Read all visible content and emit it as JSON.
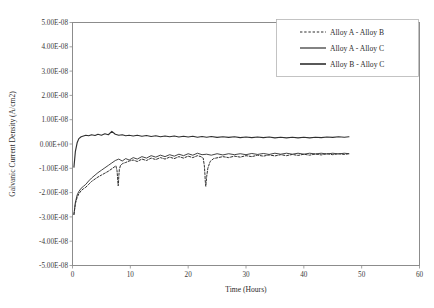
{
  "chart_data": {
    "type": "line",
    "title": "",
    "xlabel": "Time (Hours)",
    "ylabel": "Galvanic Current Density (A/cm2)",
    "xlim": [
      0,
      60
    ],
    "ylim": [
      -5e-08,
      5e-08
    ],
    "xticks": [
      0,
      10,
      20,
      30,
      40,
      50,
      60
    ],
    "xtick_labels": [
      "0",
      "10",
      "20",
      "30",
      "40",
      "50",
      "60"
    ],
    "yticks": [
      5e-08,
      4e-08,
      3e-08,
      2e-08,
      1e-08,
      0,
      -1e-08,
      -2e-08,
      -3e-08,
      -4e-08,
      -5e-08
    ],
    "ytick_labels": [
      "5.00E-08",
      "4.00E-08",
      "3.00E-08",
      "2.00E-08",
      "1.00E-08",
      "0.00E+00",
      "-1.00E-08",
      "-2.00E-08",
      "-3.00E-08",
      "-4.00E-08",
      "-5.00E-08"
    ],
    "grid": false,
    "legend_position": "top-right",
    "legend": [
      "Alloy A - Alloy B",
      "Alloy A - Alloy C",
      "Alloy B - Alloy C"
    ],
    "series": [
      {
        "name": "Alloy A - Alloy B",
        "style": "dashed",
        "color": "#2f2f2f",
        "x": [
          0.25,
          0.5,
          0.8,
          1.1,
          1.5,
          1.9,
          2.3,
          2.8,
          3.3,
          3.9,
          4.4,
          5.0,
          5.6,
          6.2,
          6.8,
          7.2,
          7.5,
          7.7,
          7.8,
          7.85,
          7.9,
          7.95,
          8.0,
          8.1,
          8.3,
          8.7,
          9.2,
          9.8,
          10.5,
          11.2,
          12.0,
          12.8,
          13.6,
          14.4,
          15.2,
          16.0,
          16.8,
          17.6,
          18.4,
          19.2,
          20.0,
          20.8,
          21.6,
          22.2,
          22.6,
          22.8,
          22.9,
          22.95,
          23.0,
          23.05,
          23.1,
          23.2,
          23.4,
          23.8,
          24.4,
          25.2,
          26.0,
          27.0,
          28.0,
          29.0,
          30.0,
          31.0,
          32.0,
          33.0,
          34.0,
          35.0,
          36.0,
          37.0,
          38.0,
          39.0,
          40.0,
          41.0,
          42.0,
          43.0,
          44.0,
          45.0,
          46.0,
          47.0,
          47.8
        ],
        "y": [
          -2.9e-08,
          -2.45e-08,
          -2.2e-08,
          -2.05e-08,
          -1.92e-08,
          -1.84e-08,
          -1.78e-08,
          -1.66e-08,
          -1.54e-08,
          -1.44e-08,
          -1.36e-08,
          -1.28e-08,
          -1.2e-08,
          -1.12e-08,
          -1.02e-08,
          -9.5e-09,
          -9e-09,
          -1.1e-08,
          -1.4e-08,
          -1.6e-08,
          -1.72e-08,
          -1.6e-08,
          -1.35e-08,
          -1.05e-08,
          -8.8e-09,
          -8e-09,
          -7.6e-09,
          -7e-09,
          -6.6e-09,
          -7.2e-09,
          -6.2e-09,
          -6.8e-09,
          -5.8e-09,
          -6.4e-09,
          -5.6e-09,
          -6.2e-09,
          -5.4e-09,
          -6e-09,
          -5.2e-09,
          -5.8e-09,
          -5e-09,
          -5.6e-09,
          -4.8e-09,
          -5.2e-09,
          -5.8e-09,
          -9e-09,
          -1.25e-08,
          -1.5e-08,
          -1.66e-08,
          -1.74e-08,
          -1.62e-08,
          -1.34e-08,
          -1e-08,
          -7.2e-09,
          -6e-09,
          -5.6e-09,
          -5.2e-09,
          -5.6e-09,
          -5e-09,
          -5.4e-09,
          -4.8e-09,
          -5.2e-09,
          -4.6e-09,
          -5e-09,
          -4.5e-09,
          -4.9e-09,
          -4.4e-09,
          -4.8e-09,
          -4.3e-09,
          -4.7e-09,
          -4.2e-09,
          -4.6e-09,
          -4.1e-09,
          -4.5e-09,
          -4e-09,
          -4.4e-09,
          -4e-09,
          -4.3e-09,
          -4e-09
        ]
      },
      {
        "name": "Alloy A - Alloy C",
        "style": "solid",
        "color": "#2f2f2f",
        "x": [
          0.25,
          0.5,
          0.8,
          1.1,
          1.5,
          1.9,
          2.3,
          2.8,
          3.3,
          3.9,
          4.4,
          5.0,
          5.6,
          6.2,
          6.8,
          7.4,
          8.0,
          8.6,
          9.2,
          9.8,
          10.5,
          11.2,
          12.0,
          12.8,
          13.6,
          14.4,
          15.2,
          16.0,
          16.8,
          17.6,
          18.4,
          19.2,
          20.0,
          20.8,
          21.6,
          22.4,
          23.2,
          24.0,
          25.0,
          26.0,
          27.0,
          28.0,
          29.0,
          30.0,
          31.0,
          32.0,
          33.0,
          34.0,
          35.0,
          36.0,
          37.0,
          38.0,
          39.0,
          40.0,
          41.0,
          42.0,
          43.0,
          44.0,
          45.0,
          46.0,
          47.0,
          47.8
        ],
        "y": [
          -2.9e-08,
          -2.4e-08,
          -2.1e-08,
          -1.95e-08,
          -1.82e-08,
          -1.74e-08,
          -1.66e-08,
          -1.52e-08,
          -1.4e-08,
          -1.28e-08,
          -1.18e-08,
          -1.08e-08,
          -9.8e-09,
          -8.8e-09,
          -7.8e-09,
          -6.8e-09,
          -6.2e-09,
          -7e-09,
          -6e-09,
          -6.6e-09,
          -5.6e-09,
          -6.2e-09,
          -5.2e-09,
          -5.8e-09,
          -4.8e-09,
          -5.4e-09,
          -4.6e-09,
          -5.2e-09,
          -4.4e-09,
          -5e-09,
          -4.2e-09,
          -4.8e-09,
          -4e-09,
          -4.6e-09,
          -3.8e-09,
          -4.4e-09,
          -4.2e-09,
          -4.6e-09,
          -4e-09,
          -4.5e-09,
          -4e-09,
          -4.4e-09,
          -4e-09,
          -4.4e-09,
          -3.9e-09,
          -4.3e-09,
          -3.9e-09,
          -4.3e-09,
          -3.8e-09,
          -4.2e-09,
          -3.8e-09,
          -4.2e-09,
          -3.8e-09,
          -4.2e-09,
          -3.8e-09,
          -4.1e-09,
          -3.8e-09,
          -4.1e-09,
          -3.8e-09,
          -4.1e-09,
          -3.8e-09,
          -4e-09
        ]
      },
      {
        "name": "Alloy B - Alloy C",
        "style": "solid",
        "color": "#2f2f2f",
        "x": [
          0.25,
          0.5,
          0.8,
          1.1,
          1.5,
          1.9,
          2.3,
          2.8,
          3.3,
          3.9,
          4.4,
          5.0,
          5.6,
          6.2,
          6.8,
          7.4,
          8.0,
          8.6,
          9.2,
          9.8,
          10.5,
          11.2,
          12.0,
          12.8,
          13.6,
          14.4,
          15.2,
          16.0,
          16.8,
          17.6,
          18.4,
          19.2,
          20.0,
          20.8,
          21.6,
          22.4,
          23.2,
          24.0,
          25.0,
          26.0,
          27.0,
          28.0,
          29.0,
          30.0,
          31.0,
          32.0,
          33.0,
          34.0,
          35.0,
          36.0,
          37.0,
          38.0,
          39.0,
          40.0,
          41.0,
          42.0,
          43.0,
          44.0,
          45.0,
          46.0,
          47.0,
          47.8
        ],
        "y": [
          -9.5e-09,
          -3e-09,
          5e-10,
          2.2e-09,
          3e-09,
          3.3e-09,
          3.6e-09,
          3.4e-09,
          3.8e-09,
          3.5e-09,
          4e-09,
          3.6e-09,
          4.2e-09,
          3.8e-09,
          5.2e-09,
          4e-09,
          3.6e-09,
          3.8e-09,
          3.4e-09,
          3.6e-09,
          3.3e-09,
          3.6e-09,
          3.2e-09,
          3.5e-09,
          3.1e-09,
          3.4e-09,
          3e-09,
          3.3e-09,
          3e-09,
          3.3e-09,
          2.9e-09,
          3.2e-09,
          2.9e-09,
          3.2e-09,
          2.8e-09,
          3.1e-09,
          2.8e-09,
          3.1e-09,
          2.7e-09,
          3e-09,
          2.7e-09,
          3e-09,
          2.6e-09,
          2.9e-09,
          2.6e-09,
          2.9e-09,
          2.6e-09,
          2.9e-09,
          2.5e-09,
          2.8e-09,
          2.5e-09,
          2.8e-09,
          2.5e-09,
          2.8e-09,
          2.5e-09,
          2.8e-09,
          2.6e-09,
          2.9e-09,
          2.7e-09,
          3e-09,
          2.8e-09,
          3e-09
        ]
      }
    ]
  }
}
